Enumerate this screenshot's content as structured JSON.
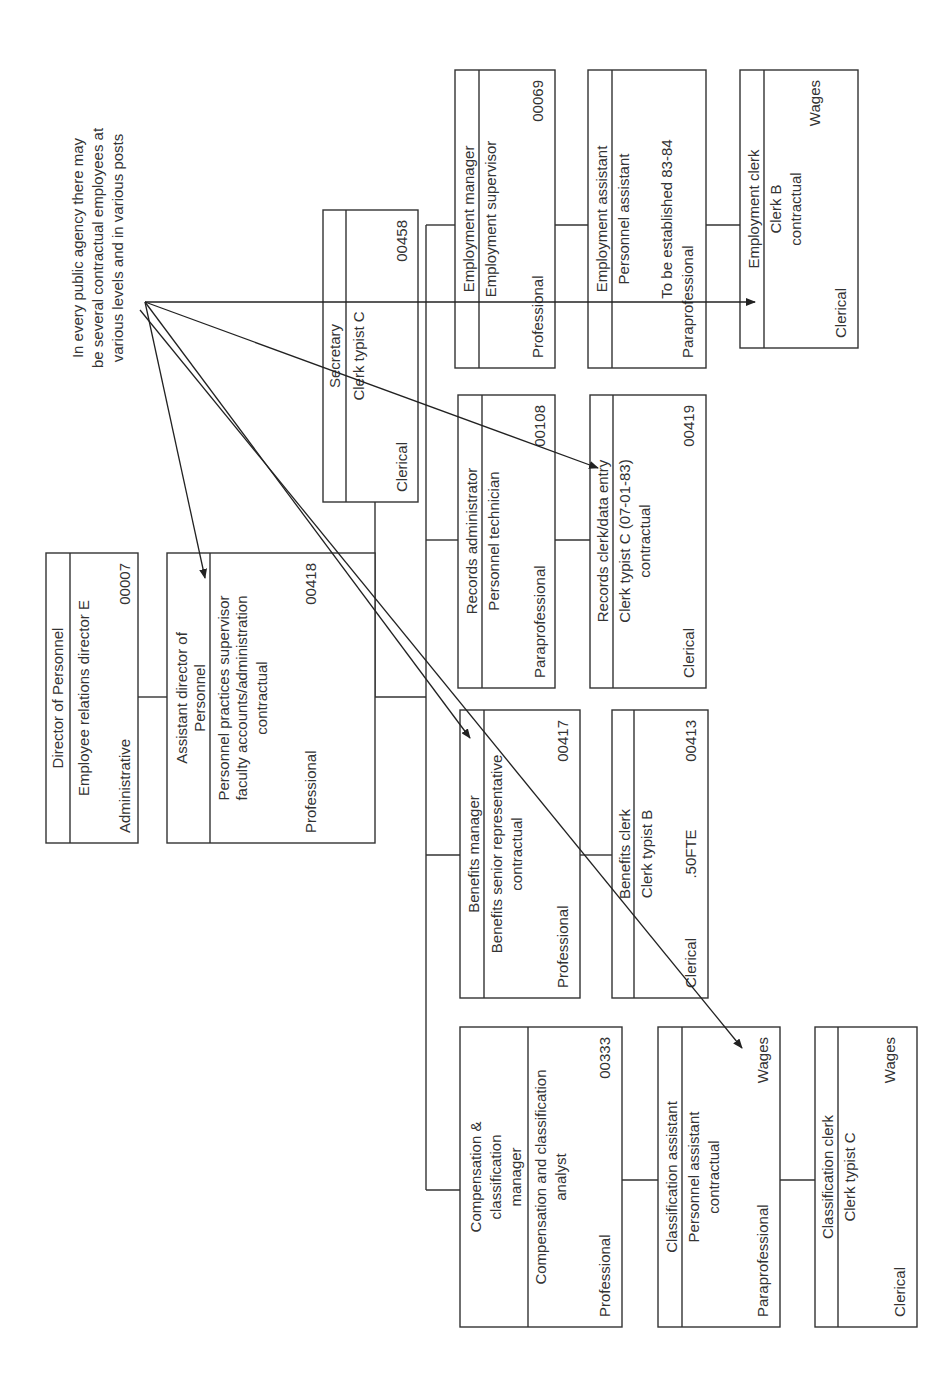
{
  "annotation": {
    "lines": [
      "In every public agency there may",
      "be several contractual employees at",
      "various levels and in various posts"
    ]
  },
  "positions": {
    "director": {
      "title": "Director of Personnel",
      "class_title": "Employee relations director E",
      "category": "Administrative",
      "code": "00007"
    },
    "assistant_director": {
      "title_lines": [
        "Assistant director of",
        "Personnel"
      ],
      "class_lines": [
        "Personnel practices supervisor",
        "faculty accounts/administration",
        "contractual"
      ],
      "category": "Professional",
      "code": "00418"
    },
    "secretary": {
      "title": "Secretary",
      "class_title": "Clerk typist C",
      "category": "Clerical",
      "code": "00458"
    },
    "employment_manager": {
      "title": "Employment manager",
      "class_title": "Employment supervisor",
      "category": "Professional",
      "code": "00069"
    },
    "records_administrator": {
      "title": "Records administrator",
      "class_title": "Personnel technician",
      "category": "Paraprofessional",
      "code": "00108"
    },
    "benefits_manager": {
      "title": "Benefits manager",
      "class_lines": [
        "Benefits senior representative",
        "contractual"
      ],
      "category": "Professional",
      "code": "00417"
    },
    "compensation_manager": {
      "title_lines": [
        "Compensation &",
        "classification",
        "manager"
      ],
      "class_lines": [
        "Compensation and classification",
        "analyst"
      ],
      "category": "Professional",
      "code": "00333"
    },
    "employment_assistant": {
      "title": "Employment assistant",
      "class_title": "Personnel assistant",
      "note": "To be established 83-84",
      "category": "Paraprofessional"
    },
    "records_clerk": {
      "title": "Records clerk/data entry",
      "class_lines": [
        "Clerk typist C (07-01-83)",
        "contractual"
      ],
      "category": "Clerical",
      "code": "00419"
    },
    "benefits_clerk": {
      "title": "Benefits clerk",
      "class_title": "Clerk typist B",
      "category": "Clerical",
      "fte": ".50FTE",
      "code": "00413"
    },
    "classification_assistant": {
      "title": "Classification assistant",
      "class_lines": [
        "Personnel assistant",
        "contractual"
      ],
      "category": "Paraprofessional",
      "funding": "Wages"
    },
    "employment_clerk": {
      "title": "Employment clerk",
      "class_lines": [
        "Clerk B",
        "contractual"
      ],
      "category": "Clerical",
      "funding": "Wages"
    },
    "classification_clerk": {
      "title": "Classification clerk",
      "class_title": "Clerk typist C",
      "category": "Clerical",
      "funding": "Wages"
    }
  },
  "colors": {
    "line": "#333333",
    "text": "#333333",
    "background": "#ffffff"
  }
}
